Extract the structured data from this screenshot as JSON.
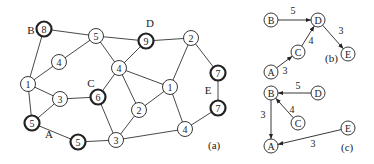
{
  "graph_a": {
    "caption": "(a)",
    "caption_pos": [
      208,
      149
    ],
    "nodes": [
      {
        "id": "n8",
        "label": "8",
        "x": 44,
        "y": 29,
        "bold": true
      },
      {
        "id": "n5t",
        "label": "5",
        "x": 96,
        "y": 36,
        "bold": false
      },
      {
        "id": "n9",
        "label": "9",
        "x": 146,
        "y": 41,
        "bold": true
      },
      {
        "id": "n2t",
        "label": "2",
        "x": 191,
        "y": 38,
        "bold": false
      },
      {
        "id": "n4l",
        "label": "4",
        "x": 59,
        "y": 62,
        "bold": false
      },
      {
        "id": "n4c",
        "label": "4",
        "x": 119,
        "y": 68,
        "bold": false
      },
      {
        "id": "n1l",
        "label": "1",
        "x": 28,
        "y": 84,
        "bold": false
      },
      {
        "id": "n3l",
        "label": "3",
        "x": 60,
        "y": 99,
        "bold": false
      },
      {
        "id": "n6",
        "label": "6",
        "x": 98,
        "y": 97,
        "bold": true
      },
      {
        "id": "n1r",
        "label": "1",
        "x": 170,
        "y": 87,
        "bold": false
      },
      {
        "id": "n7a",
        "label": "7",
        "x": 218,
        "y": 73,
        "bold": true
      },
      {
        "id": "n7b",
        "label": "7",
        "x": 218,
        "y": 108,
        "bold": true
      },
      {
        "id": "n2c",
        "label": "2",
        "x": 139,
        "y": 110,
        "bold": false
      },
      {
        "id": "n5a",
        "label": "5",
        "x": 32,
        "y": 123,
        "bold": true
      },
      {
        "id": "n5b",
        "label": "5",
        "x": 78,
        "y": 142,
        "bold": true
      },
      {
        "id": "n3b",
        "label": "3",
        "x": 116,
        "y": 140,
        "bold": false
      },
      {
        "id": "n4b",
        "label": "4",
        "x": 185,
        "y": 129,
        "bold": false
      }
    ],
    "edges": [
      [
        "n8",
        "n5t"
      ],
      [
        "n8",
        "n1l"
      ],
      [
        "n5t",
        "n9"
      ],
      [
        "n5t",
        "n4l"
      ],
      [
        "n5t",
        "n4c"
      ],
      [
        "n4l",
        "n1l"
      ],
      [
        "n1l",
        "n3l"
      ],
      [
        "n1l",
        "n5a"
      ],
      [
        "n3l",
        "n6"
      ],
      [
        "n3l",
        "n5a"
      ],
      [
        "n5a",
        "n5b"
      ],
      [
        "n5b",
        "n3b"
      ],
      [
        "n9",
        "n2t"
      ],
      [
        "n9",
        "n4c"
      ],
      [
        "n4c",
        "n6"
      ],
      [
        "n4c",
        "n2c"
      ],
      [
        "n4c",
        "n1r"
      ],
      [
        "n6",
        "n3b"
      ],
      [
        "n2c",
        "n3b"
      ],
      [
        "n2c",
        "n1r"
      ],
      [
        "n1r",
        "n2t"
      ],
      [
        "n1r",
        "n4b"
      ],
      [
        "n3b",
        "n4b"
      ],
      [
        "n2t",
        "n7a"
      ],
      [
        "n7a",
        "n7b"
      ],
      [
        "n7b",
        "n4b"
      ]
    ],
    "region_labels": [
      {
        "text": "B",
        "x": 31,
        "y": 34
      },
      {
        "text": "D",
        "x": 150,
        "y": 27
      },
      {
        "text": "C",
        "x": 91,
        "y": 87
      },
      {
        "text": "E",
        "x": 208,
        "y": 94
      },
      {
        "text": "A",
        "x": 49,
        "y": 138
      }
    ]
  },
  "graph_b": {
    "caption": "(b)",
    "caption_pos": [
      325,
      62
    ],
    "nodes": [
      {
        "id": "B",
        "label": "B",
        "x": 271,
        "y": 20
      },
      {
        "id": "D",
        "label": "D",
        "x": 318,
        "y": 20
      },
      {
        "id": "C",
        "label": "C",
        "x": 298,
        "y": 52
      },
      {
        "id": "E",
        "label": "E",
        "x": 348,
        "y": 54
      },
      {
        "id": "A",
        "label": "A",
        "x": 271,
        "y": 72
      }
    ],
    "edges": [
      {
        "from": "B",
        "to": "D",
        "weight": "5",
        "lx": 293,
        "ly": 14
      },
      {
        "from": "C",
        "to": "D",
        "weight": "4",
        "lx": 311,
        "ly": 44
      },
      {
        "from": "D",
        "to": "E",
        "weight": "3",
        "lx": 341,
        "ly": 34
      },
      {
        "from": "A",
        "to": "C",
        "weight": "3",
        "lx": 285,
        "ly": 74
      }
    ]
  },
  "graph_c": {
    "caption": "(c)",
    "caption_pos": [
      341,
      151
    ],
    "nodes": [
      {
        "id": "B",
        "label": "B",
        "x": 271,
        "y": 93
      },
      {
        "id": "D",
        "label": "D",
        "x": 318,
        "y": 93
      },
      {
        "id": "C",
        "label": "C",
        "x": 298,
        "y": 123
      },
      {
        "id": "E",
        "label": "E",
        "x": 348,
        "y": 128
      },
      {
        "id": "A",
        "label": "A",
        "x": 271,
        "y": 146
      }
    ],
    "edges": [
      {
        "from": "D",
        "to": "B",
        "weight": "5",
        "lx": 298,
        "ly": 89
      },
      {
        "from": "C",
        "to": "B",
        "weight": "4",
        "lx": 292,
        "ly": 113
      },
      {
        "from": "B",
        "to": "A",
        "weight": "3",
        "lx": 263,
        "ly": 118
      },
      {
        "from": "E",
        "to": "A",
        "weight": "3",
        "lx": 313,
        "ly": 147
      }
    ]
  }
}
